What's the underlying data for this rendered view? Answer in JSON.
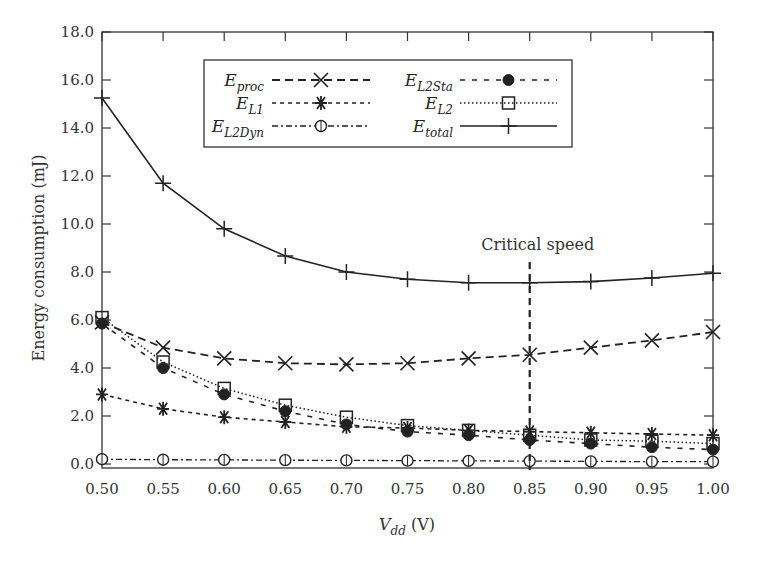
{
  "chart_data": {
    "type": "line",
    "title": "",
    "xlabel": "V_dd (V)",
    "xlabel_main": "V",
    "xlabel_sub": "dd",
    "xlabel_unit": " (V)",
    "ylabel": "Energy consumption (mJ)",
    "xlim": [
      0.5,
      1.0
    ],
    "ylim": [
      0,
      18
    ],
    "x": [
      0.5,
      0.55,
      0.6,
      0.65,
      0.7,
      0.75,
      0.8,
      0.85,
      0.9,
      0.95,
      1.0
    ],
    "x_tick_labels": [
      "0.50",
      "0.55",
      "0.60",
      "0.65",
      "0.70",
      "0.75",
      "0.80",
      "0.85",
      "0.90",
      "0.95",
      "1.00"
    ],
    "y_ticks": [
      0,
      2,
      4,
      6,
      8,
      10,
      12,
      14,
      16,
      18
    ],
    "y_tick_labels": [
      "0.0",
      "2.0",
      "4.0",
      "6.0",
      "8.0",
      "10.0",
      "12.0",
      "14.0",
      "16.0",
      "18.0"
    ],
    "grid": false,
    "legend_position": "upper center (inside)",
    "series": [
      {
        "name": "E_proc",
        "main": "E",
        "sub": "proc",
        "style": "dashed",
        "marker": "x",
        "values": [
          5.9,
          4.85,
          4.4,
          4.2,
          4.15,
          4.2,
          4.4,
          4.55,
          4.85,
          5.15,
          5.5
        ]
      },
      {
        "name": "E_L1",
        "main": "E",
        "sub": "L1",
        "style": "short-dashed",
        "marker": "asterisk",
        "values": [
          2.9,
          2.3,
          1.95,
          1.75,
          1.55,
          1.5,
          1.4,
          1.35,
          1.3,
          1.25,
          1.2
        ]
      },
      {
        "name": "E_L2Dyn",
        "main": "E",
        "sub": "L2Dyn",
        "style": "dash-dot",
        "marker": "open-circle",
        "values": [
          0.2,
          0.18,
          0.17,
          0.16,
          0.15,
          0.14,
          0.13,
          0.12,
          0.11,
          0.1,
          0.1
        ]
      },
      {
        "name": "E_L2Sta",
        "main": "E",
        "sub": "L2Sta",
        "style": "sparse-dashed",
        "marker": "filled-circle",
        "values": [
          5.85,
          4.0,
          2.9,
          2.2,
          1.65,
          1.35,
          1.2,
          1.0,
          0.85,
          0.7,
          0.6
        ]
      },
      {
        "name": "E_L2",
        "main": "E",
        "sub": "L2",
        "style": "dotted",
        "marker": "open-square",
        "values": [
          6.1,
          4.25,
          3.15,
          2.45,
          1.95,
          1.6,
          1.4,
          1.2,
          1.0,
          0.95,
          0.85
        ]
      },
      {
        "name": "E_total",
        "main": "E",
        "sub": "total",
        "style": "solid",
        "marker": "plus",
        "values": [
          15.25,
          11.7,
          9.8,
          8.67,
          8.0,
          7.7,
          7.55,
          7.55,
          7.6,
          7.75,
          7.95
        ]
      }
    ],
    "annotations": [
      {
        "text": "Critical speed",
        "x": 0.85,
        "type": "vertical dashed line"
      }
    ]
  }
}
